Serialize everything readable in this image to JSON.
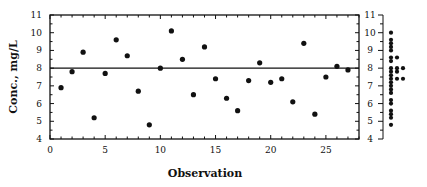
{
  "chart_data": {
    "type": "scatter",
    "title": "",
    "xlabel": "Observation",
    "ylabel": "Conc., mg/L",
    "xlim": [
      0,
      28
    ],
    "ylim": [
      4,
      11
    ],
    "xticks": [
      0,
      5,
      10,
      15,
      20,
      25
    ],
    "yticks": [
      4,
      5,
      6,
      7,
      8,
      9,
      10,
      11
    ],
    "grid": false,
    "legend": null,
    "reference_line": {
      "orientation": "horizontal",
      "y": 8.0,
      "label": "mean"
    },
    "x": [
      1,
      2,
      3,
      4,
      5,
      6,
      7,
      8,
      9,
      10,
      11,
      12,
      13,
      14,
      15,
      16,
      17,
      18,
      19,
      20,
      21,
      22,
      23,
      24,
      25,
      26,
      27
    ],
    "series": [
      {
        "name": "Conc., mg/L",
        "values": [
          6.9,
          7.8,
          8.9,
          5.2,
          7.7,
          9.6,
          8.7,
          6.7,
          4.8,
          8.0,
          10.1,
          8.5,
          6.5,
          9.2,
          7.4,
          6.3,
          5.6,
          7.3,
          8.3,
          7.2,
          7.4,
          6.1,
          9.4,
          5.4,
          7.5,
          8.1,
          7.9
        ]
      }
    ],
    "side_panel": {
      "type": "dot_plot",
      "description": "Marginal dot plot (distribution) of the same concentration values on a matching 4-11 axis",
      "yticks": [
        4,
        5,
        6,
        7,
        8,
        9,
        10,
        11
      ]
    }
  }
}
